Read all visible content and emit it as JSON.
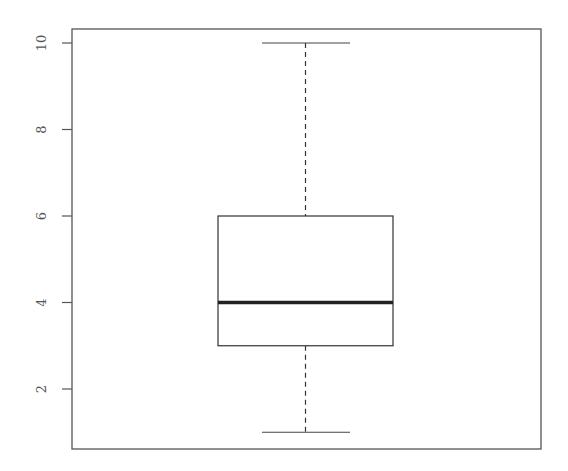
{
  "chart_data": {
    "type": "boxplot",
    "title": "",
    "xlabel": "",
    "ylabel": "",
    "ylim": [
      0.7,
      10.3
    ],
    "yticks": [
      2,
      4,
      6,
      8,
      10
    ],
    "ytick_labels": [
      "2",
      "4",
      "6",
      "8",
      "10"
    ],
    "grid": false,
    "legend": null,
    "series": [
      {
        "name": "",
        "min": 1,
        "q1": 3,
        "median": 4,
        "q3": 6,
        "max": 10,
        "outliers": []
      }
    ]
  },
  "colors": {
    "frame": "#555555",
    "box": "#333333",
    "median": "#222222",
    "whisker": "#333333",
    "text": "#555555"
  }
}
